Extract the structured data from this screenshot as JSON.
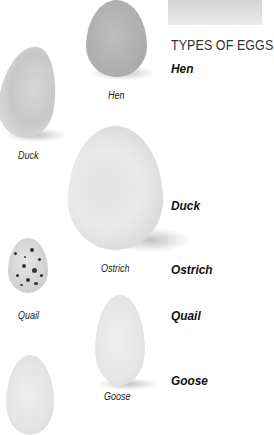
{
  "title": "TYPES OF EGGS",
  "list": [
    "Hen",
    "Duck",
    "Ostrich",
    "Quail",
    "Goose"
  ],
  "captions": {
    "hen": "Hen",
    "duck": "Duck",
    "ostrich": "Ostrich",
    "quail": "Quail",
    "goose": "Goose"
  },
  "colors": {
    "background": "#ffffff",
    "text": "#111111",
    "hen_egg": "#b8b8b8",
    "white_egg": "#ececec"
  }
}
